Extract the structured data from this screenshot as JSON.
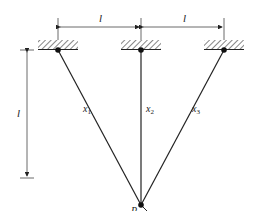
{
  "diagram": {
    "type": "three-bar truss / suspended cables",
    "dimensions": {
      "horizontal_left": "l",
      "horizontal_right": "l",
      "vertical": "l"
    },
    "members": [
      {
        "name": "x",
        "sub": "1"
      },
      {
        "name": "x",
        "sub": "2"
      },
      {
        "name": "x",
        "sub": "3"
      }
    ],
    "load_point": "P",
    "colors": {
      "line": "#222222",
      "background": "#ffffff"
    }
  }
}
